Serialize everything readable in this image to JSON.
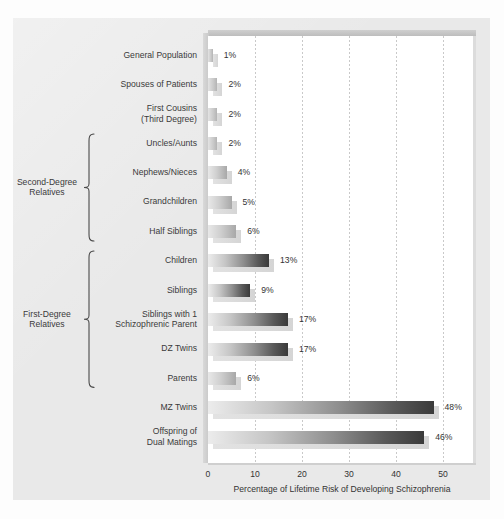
{
  "chart_data": {
    "type": "bar",
    "orientation": "horizontal",
    "title": "",
    "xlabel": "Percentage of Lifetime Risk of Developing Schizophrenia",
    "ylabel": "",
    "xlim": [
      0,
      50
    ],
    "xticks": [
      0,
      10,
      20,
      30,
      40,
      50
    ],
    "xtick_labels": [
      "0",
      "10",
      "20",
      "30",
      "40",
      "50"
    ],
    "grid": "vertical-dotted",
    "legend": "none",
    "value_suffix": "%",
    "categories": [
      "General Population",
      "Spouses of Patients",
      "First Cousins\n(Third Degree)",
      "Uncles/Aunts",
      "Nephews/Nieces",
      "Grandchildren",
      "Half Siblings",
      "Children",
      "Siblings",
      "Siblings with 1\nSchizophrenic Parent",
      "DZ Twins",
      "Parents",
      "MZ Twins",
      "Offspring of\nDual Matings"
    ],
    "values": [
      1,
      2,
      2,
      2,
      4,
      5,
      6,
      13,
      9,
      17,
      17,
      6,
      48,
      46
    ],
    "value_labels": [
      "1%",
      "2%",
      "2%",
      "2%",
      "4%",
      "5%",
      "6%",
      "13%",
      "9%",
      "17%",
      "17%",
      "6%",
      "48%",
      "46%"
    ],
    "groups": [
      {
        "label": "Second-Degree\nRelatives",
        "from_category": "Uncles/Aunts",
        "to_category": "Half Siblings"
      },
      {
        "label": "First-Degree\nRelatives",
        "from_category": "Children",
        "to_category": "Parents"
      }
    ],
    "colors": {
      "panel_background": "#e9e9e9",
      "plot_background": "#ffffff",
      "bar_gradient_start": "#ececec",
      "bar_gradient_end": "#3a3a3a",
      "bar_shadow": "#d9d9d9",
      "text": "#333333",
      "gridline": "#c9c9c9"
    }
  }
}
